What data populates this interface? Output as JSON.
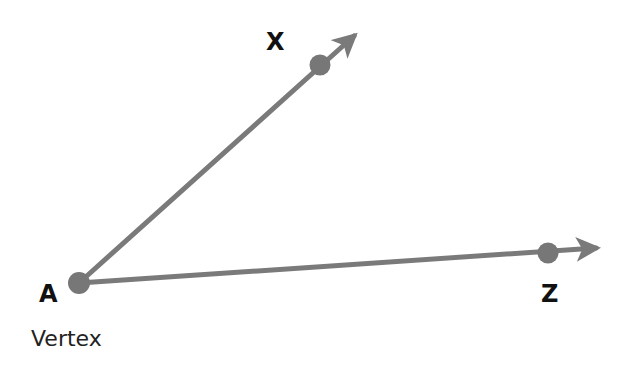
{
  "diagram": {
    "type": "angle",
    "colors": {
      "ray": "#7a7a7a",
      "point": "#777777",
      "text": "#111111"
    },
    "vertex": {
      "label": "A",
      "caption": "Vertex",
      "x": 79,
      "y": 283
    },
    "rays": [
      {
        "name": "ray-AX",
        "point_label": "X",
        "point": {
          "x": 320,
          "y": 65
        },
        "arrow_tip": {
          "x": 360,
          "y": 31
        }
      },
      {
        "name": "ray-AZ",
        "point_label": "Z",
        "point": {
          "x": 548,
          "y": 253
        },
        "arrow_tip": {
          "x": 602,
          "y": 247
        }
      }
    ]
  }
}
